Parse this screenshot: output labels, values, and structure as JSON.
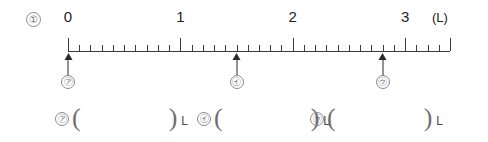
{
  "problem": {
    "number": "①"
  },
  "scale": {
    "unit": "(L)",
    "labels": [
      {
        "text": "0",
        "value": 0
      },
      {
        "text": "1",
        "value": 1
      },
      {
        "text": "2",
        "value": 2
      },
      {
        "text": "3",
        "value": 3
      }
    ]
  },
  "markers": [
    {
      "tag": "㋐",
      "value": 0
    },
    {
      "tag": "㋑",
      "value": 1.5
    },
    {
      "tag": "㋒",
      "value": 2.8
    }
  ],
  "answers": [
    {
      "tag": "㋐",
      "open": "(",
      "value": "",
      "close": ")",
      "unit": "L"
    },
    {
      "tag": "㋑",
      "open": "(",
      "value": "",
      "close": ")",
      "unit": "L"
    },
    {
      "tag": "㋒",
      "open": "(",
      "value": "",
      "close": ")",
      "unit": "L"
    }
  ],
  "chart_data": {
    "type": "line",
    "title": "",
    "xlabel": "(L)",
    "ylabel": "",
    "xlim": [
      0,
      3.4
    ],
    "grid": false,
    "categories": [
      "0",
      "1",
      "2",
      "3"
    ],
    "x": [
      0,
      1,
      2,
      3
    ],
    "minor_tick_step": 0.1,
    "major_tick_step": 1,
    "annotations": [
      {
        "label": "㋐",
        "x": 0
      },
      {
        "label": "㋑",
        "x": 1.5
      },
      {
        "label": "㋒",
        "x": 2.8
      }
    ]
  }
}
